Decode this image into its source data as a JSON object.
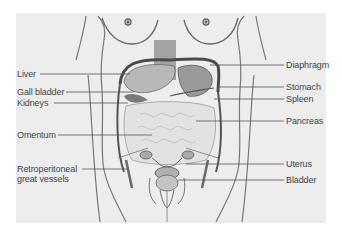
{
  "figure": {
    "background_color": "#ededed",
    "line_color": "#555555",
    "labels_left": [
      {
        "id": "liver",
        "text": "Liver"
      },
      {
        "id": "gall-bladder",
        "text": "Gall bladder"
      },
      {
        "id": "kidneys",
        "text": "Kidneys"
      },
      {
        "id": "omentum",
        "text": "Omentum"
      },
      {
        "id": "retroperitoneal",
        "text": "Retroperitoneal",
        "text2": "great vessels"
      }
    ],
    "labels_right": [
      {
        "id": "diaphragm",
        "text": "Diaphragm"
      },
      {
        "id": "stomach",
        "text": "Stomach"
      },
      {
        "id": "spleen",
        "text": "Spleen"
      },
      {
        "id": "pancreas",
        "text": "Pancreas"
      },
      {
        "id": "uterus",
        "text": "Uterus"
      },
      {
        "id": "bladder",
        "text": "Bladder"
      }
    ]
  }
}
